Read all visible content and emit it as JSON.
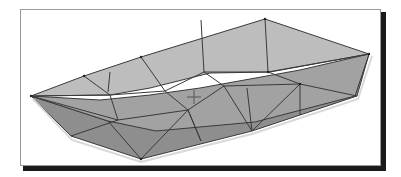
{
  "figure": {
    "colors": {
      "frame_border": "#9a9a9a",
      "shadow": "#1a1a1a",
      "deck_face": "#b9b9b9",
      "hull_side_face": "#9c9c9c",
      "hull_bottom_face": "#8c8c8c",
      "edge": "#3a3a3a",
      "rim_highlight": "#d6d6d6"
    },
    "vertices": {
      "bow": [
        31,
        96
      ],
      "top_rim": [
        [
          31,
          96
        ],
        [
          84,
          76
        ],
        [
          141,
          57
        ],
        [
          265,
          19
        ],
        [
          369,
          54
        ]
      ],
      "stern_bottom": [
        [
          357,
          96
        ]
      ],
      "chine": [
        [
          31,
          96
        ],
        [
          108,
          121
        ],
        [
          156,
          131
        ],
        [
          255,
          122
        ],
        [
          355,
          96
        ]
      ],
      "keel": [
        [
          71,
          136
        ],
        [
          141,
          159
        ],
        [
          252,
          131
        ],
        [
          300,
          115
        ],
        [
          352,
          98
        ]
      ]
    },
    "cursor": {
      "type": "crosshair",
      "x": 194,
      "y": 97
    }
  }
}
